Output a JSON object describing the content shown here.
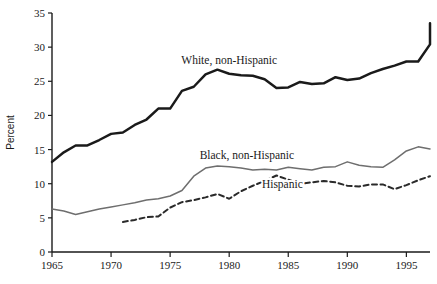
{
  "chart_data": {
    "type": "line",
    "title": "",
    "xlabel": "",
    "ylabel": "Percent",
    "xlim": [
      1965,
      1997
    ],
    "ylim": [
      0,
      35
    ],
    "grid": false,
    "legend_position": "inline-annotations",
    "x_ticks": [
      "1965",
      "1970",
      "1975",
      "1980",
      "1985",
      "1990",
      "1995"
    ],
    "x_tick_values": [
      1965,
      1970,
      1975,
      1980,
      1985,
      1990,
      1995
    ],
    "y_ticks": [
      "0",
      "5",
      "10",
      "15",
      "20",
      "25",
      "30",
      "35"
    ],
    "y_tick_values": [
      0,
      5,
      10,
      15,
      20,
      25,
      30,
      35
    ],
    "series": [
      {
        "name": "White, non-Hispanic",
        "style": "solid",
        "color": "#1a1a1a",
        "width": 2.5,
        "label_x": 1980.0,
        "label_y": 27.6,
        "x": [
          1965,
          1966,
          1967,
          1968,
          1969,
          1970,
          1971,
          1972,
          1973,
          1974,
          1975,
          1976,
          1977,
          1978,
          1979,
          1980,
          1981,
          1982,
          1983,
          1984,
          1985,
          1986,
          1987,
          1988,
          1989,
          1990,
          1991,
          1992,
          1993,
          1994,
          1995,
          1996,
          1997
        ],
        "values": [
          13.2,
          14.6,
          15.6,
          15.6,
          16.4,
          17.3,
          17.5,
          18.6,
          19.4,
          21.0,
          21.0,
          23.6,
          24.2,
          26.0,
          26.7,
          26.1,
          25.9,
          25.8,
          25.3,
          24.0,
          24.1,
          24.9,
          24.6,
          24.7,
          25.6,
          25.2,
          25.4,
          26.2,
          26.8,
          27.3,
          27.9,
          27.9,
          30.4
        ],
        "values_note": "final point 1997 = 33.5",
        "final_point": {
          "x": 1997,
          "y": 33.5
        }
      },
      {
        "name": "Black, non-Hispanic",
        "style": "solid",
        "color": "#6e6e6e",
        "width": 1.5,
        "label_x": 1981.5,
        "label_y": 13.6,
        "x": [
          1965,
          1966,
          1967,
          1968,
          1969,
          1970,
          1971,
          1972,
          1973,
          1974,
          1975,
          1976,
          1977,
          1978,
          1979,
          1980,
          1981,
          1982,
          1983,
          1984,
          1985,
          1986,
          1987,
          1988,
          1989,
          1990,
          1991,
          1992,
          1993,
          1994,
          1995,
          1996,
          1997
        ],
        "values": [
          6.3,
          6.0,
          5.5,
          5.9,
          6.3,
          6.6,
          6.9,
          7.2,
          7.6,
          7.8,
          8.2,
          9.0,
          11.1,
          12.3,
          12.6,
          12.5,
          12.3,
          12.0,
          12.1,
          12.0,
          12.4,
          12.2,
          12.0,
          12.4,
          12.5,
          13.2,
          12.7,
          12.5,
          12.4,
          13.5,
          14.8,
          15.4,
          15.1
        ]
      },
      {
        "name": "Hispanic",
        "style": "dashed",
        "color": "#2a2a2a",
        "width": 2.0,
        "label_x": 1984.5,
        "label_y": 9.4,
        "x": [
          1971,
          1972,
          1973,
          1974,
          1975,
          1976,
          1977,
          1978,
          1979,
          1980,
          1981,
          1982,
          1983,
          1984,
          1985,
          1986,
          1987,
          1988,
          1989,
          1990,
          1991,
          1992,
          1993,
          1994,
          1995,
          1996,
          1997
        ],
        "values": [
          4.4,
          4.7,
          5.1,
          5.2,
          6.5,
          7.3,
          7.6,
          8.0,
          8.5,
          7.8,
          8.9,
          9.7,
          10.4,
          11.2,
          10.6,
          10.0,
          10.2,
          10.4,
          10.2,
          9.7,
          9.6,
          9.9,
          9.9,
          9.2,
          9.8,
          10.5,
          11.1
        ]
      }
    ]
  },
  "axis": {
    "y_title": "Percent"
  },
  "labels": {
    "white": "White, non-Hispanic",
    "black": "Black, non-Hispanic",
    "hispanic": "Hispanic"
  }
}
